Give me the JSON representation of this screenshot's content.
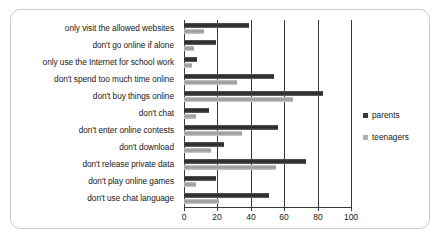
{
  "chart_data": {
    "type": "bar",
    "orientation": "horizontal",
    "title": "",
    "xlabel": "",
    "ylabel": "",
    "xlim": [
      0,
      100
    ],
    "xticks": [
      0,
      20,
      40,
      60,
      80,
      100
    ],
    "grid": true,
    "legend_position": "right",
    "categories": [
      "only visit the allowed websites",
      "don't go online if alone",
      "only use the Internet for school work",
      "don't spend too much time online",
      "don't buy things online",
      "don't chat",
      "don't enter online contests",
      "don't download",
      "don't release private data",
      "don't play online games",
      "don't use chat language"
    ],
    "series": [
      {
        "name": "parents",
        "color": "#3a3a3a",
        "values": [
          39,
          19,
          8,
          54,
          83,
          15,
          56,
          24,
          73,
          19,
          51
        ]
      },
      {
        "name": "teenagers",
        "color": "#b0b0b0",
        "values": [
          12,
          6,
          5,
          32,
          65,
          7,
          35,
          16,
          55,
          7,
          21
        ]
      }
    ]
  },
  "legend": {
    "items": [
      {
        "label": "parents",
        "swatch": "parents-swatch-icon"
      },
      {
        "label": "teenagers",
        "swatch": "teenagers-swatch-icon"
      }
    ]
  },
  "axis": {
    "tick_labels": [
      "0",
      "20",
      "40",
      "60",
      "80",
      "100"
    ]
  }
}
